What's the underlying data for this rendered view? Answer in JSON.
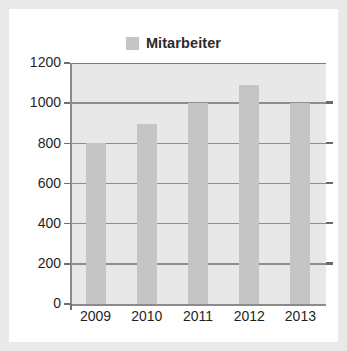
{
  "legend": {
    "swatch_name": "series-color-swatch",
    "label": "Mitarbeiter",
    "color": "#c5c5c5"
  },
  "axes": {
    "y_ticks": [
      "1200",
      "1000",
      "800",
      "600",
      "400",
      "200",
      "0"
    ],
    "x_ticks": [
      "2009",
      "2010",
      "2011",
      "2012",
      "2013"
    ]
  },
  "colors": {
    "bar": "#c5c5c5",
    "plot_background": "#e8e8e8",
    "gridline": "#8d8d8d",
    "card_background": "#ffffff",
    "page_background": "#e9e9e9",
    "text": "#1f1f1f"
  },
  "chart_data": {
    "type": "bar",
    "title": "",
    "categories": [
      "2009",
      "2010",
      "2011",
      "2012",
      "2013"
    ],
    "values": [
      800,
      895,
      1000,
      1090,
      1000
    ],
    "series": [
      {
        "name": "Mitarbeiter",
        "values": [
          800,
          895,
          1000,
          1090,
          1000
        ],
        "color": "#c5c5c5"
      }
    ],
    "xlabel": "",
    "ylabel": "",
    "ylim": [
      0,
      1200
    ],
    "ytick_values": [
      0,
      200,
      400,
      600,
      800,
      1000,
      1200
    ],
    "grid": true,
    "legend_position": "top-center"
  }
}
